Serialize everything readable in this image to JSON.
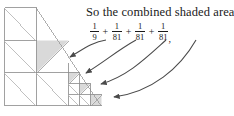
{
  "caption": {
    "text": "So the combined shaded area is"
  },
  "formula": {
    "terms": [
      {
        "numerator": "1",
        "denominator": "9"
      },
      {
        "numerator": "1",
        "denominator": "81"
      },
      {
        "numerator": "1",
        "denominator": "81"
      },
      {
        "numerator": "1",
        "denominator": "81"
      }
    ],
    "operator": "+",
    "trailing": ","
  },
  "figure": {
    "line_color": "#8a8a8a",
    "shade_color": "#d9d9d9",
    "arrow_color": "#4a4a4a",
    "arrow_count": 4
  }
}
